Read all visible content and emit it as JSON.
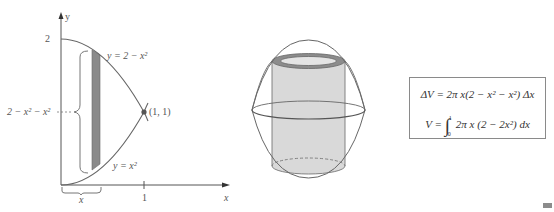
{
  "figure": {
    "left_panel": {
      "axes": {
        "x_label": "x",
        "y_label": "y",
        "y_tick": "2",
        "x_tick": "1",
        "x_marker": "x"
      },
      "curves": {
        "upper": "y = 2 − x²",
        "lower": "y = x²"
      },
      "intersection_label": "(1, 1)",
      "height_label": "2 − x² − x²",
      "strip_color": "#8a8a8a"
    },
    "middle_panel": {
      "description": "solid of revolution with cylindrical shell",
      "shell_fill": "#d9d9d9",
      "shell_rim": "#8c8c8c"
    },
    "right_panel": {
      "formula_1": "ΔV = 2π x(2 − x² − x²) Δx",
      "formula_2_prefix": "V = ",
      "integral_sign": "∫",
      "upper_limit": "1",
      "lower_limit": "0",
      "formula_2_body": "2π x (2 − 2x²) dx"
    }
  },
  "colors": {
    "line": "#666666",
    "text": "#444444",
    "strip": "#8a8a8a"
  }
}
